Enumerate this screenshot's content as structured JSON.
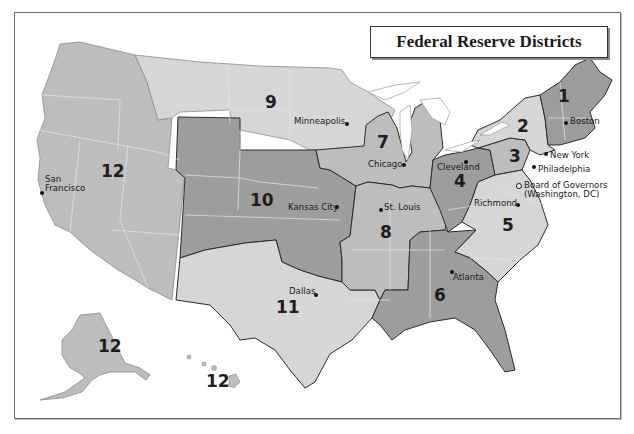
{
  "title": "Federal Reserve Districts",
  "colors": {
    "light": "#d6d6d6",
    "mid": "#bdbdbd",
    "dark": "#9d9d9d",
    "border": "#2b2b2b",
    "state_line": "#e6e6e6",
    "water": "#ffffff"
  },
  "districts": [
    {
      "number": "1",
      "bank_city": "Boston",
      "shade": "dark"
    },
    {
      "number": "2",
      "bank_city": "New York",
      "shade": "light"
    },
    {
      "number": "3",
      "bank_city": "Philadelphia",
      "shade": "mid"
    },
    {
      "number": "4",
      "bank_city": "Cleveland",
      "shade": "dark"
    },
    {
      "number": "5",
      "bank_city": "Richmond",
      "shade": "light"
    },
    {
      "number": "6",
      "bank_city": "Atlanta",
      "shade": "dark"
    },
    {
      "number": "7",
      "bank_city": "Chicago",
      "shade": "mid"
    },
    {
      "number": "8",
      "bank_city": "St. Louis",
      "shade": "mid"
    },
    {
      "number": "9",
      "bank_city": "Minneapolis",
      "shade": "light"
    },
    {
      "number": "10",
      "bank_city": "Kansas City",
      "shade": "dark"
    },
    {
      "number": "11",
      "bank_city": "Dallas",
      "shade": "light"
    },
    {
      "number": "12",
      "bank_city": "San Francisco",
      "shade": "mid"
    }
  ],
  "district_labels": {
    "d1": "1",
    "d2": "2",
    "d3": "3",
    "d4": "4",
    "d5": "5",
    "d6": "6",
    "d7": "7",
    "d8": "8",
    "d9": "9",
    "d10": "10",
    "d11": "11",
    "d12_mainland": "12",
    "d12_alaska": "12",
    "d12_hawaii": "12"
  },
  "cities": {
    "boston": "Boston",
    "new_york": "New York",
    "philadelphia": "Philadelphia",
    "cleveland": "Cleveland",
    "richmond": "Richmond",
    "board_line1": "Board of Governors",
    "board_line2": "(Washington, DC)",
    "atlanta": "Atlanta",
    "chicago": "Chicago",
    "st_louis": "St. Louis",
    "minneapolis": "Minneapolis",
    "kansas_city": "Kansas City",
    "dallas": "Dallas",
    "san_francisco_line1": "San",
    "san_francisco_line2": "Francisco"
  }
}
